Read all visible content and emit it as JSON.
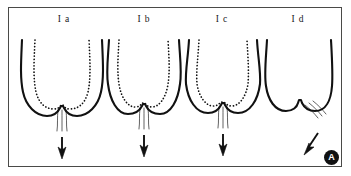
{
  "figure": {
    "kind": "anatomical-line-diagram",
    "badge_label": "A",
    "background_color": "#ffffff",
    "ink_color": "#111111",
    "frame_color": "#4a4a48",
    "panels": [
      {
        "id": "Ia",
        "label": "I a",
        "label_x": 64,
        "contour_has_dotted_inner_outline": true,
        "flow_line_count": 3,
        "flow_direction": "vertical",
        "arrow_label": "",
        "arrow_direction": "down",
        "body": "M 22 40 C 21 62 20 78 23 92 C 26 106 36 116 47 116 C 54 116 58 112 60 108 L 61 106 L 63 106 L 64 108 C 66 112 70 116 77 116 C 88 116 98 106 101 92 C 104 78 103 62 102 40",
        "dotted": "M 35 40 C 34 62 33 78 36 92 C 39 104 46 109 54 109 C 58 109 60 107 61 105 L 63 105 C 64 107 66 109 70 109 C 78 109 85 104 88 92 C 91 78 90 62 89 40",
        "flow_paths": [
          "M 58 110 C 57 118 58 124 57 131",
          "M 62 110 C 62 118 62 124 62 131",
          "M 66 110 C 67 118 66 124 67 131"
        ],
        "arrow_shaft": "M 62 137 L 62 152",
        "arrow_head": "62,159 58,147 62,150 66,147"
      },
      {
        "id": "Ib",
        "label": "I b",
        "label_x": 144,
        "contour_has_dotted_inner_outline": true,
        "flow_line_count": 3,
        "flow_direction": "vertical",
        "arrow_label": "",
        "arrow_direction": "down",
        "body": "M 109 40 C 108 58 106 72 108 84 C 110 100 117 114 128 114 C 136 114 140 110 142 106 L 143 104 L 145 104 L 146 106 C 148 110 152 114 160 114 C 171 114 178 100 180 84 C 182 72 180 58 179 40",
        "dotted": "M 119 40 C 118 58 117 72 119 84 C 121 98 128 107 135 107 C 139 107 141 105 142 103 L 145 103 C 146 105 148 107 152 107 C 159 107 166 98 168 84 C 170 72 169 58 168 40",
        "flow_paths": [
          "M 140 108 C 139 116 140 122 139 129",
          "M 144 108 C 144 116 144 122 144 129",
          "M 148 108 C 149 116 148 122 149 129"
        ],
        "arrow_shaft": "M 144 135 L 144 150",
        "arrow_head": "144,157 140,145 144,148 148,145"
      },
      {
        "id": "Ic",
        "label": "I c",
        "label_x": 222,
        "contour_has_dotted_inner_outline": true,
        "flow_line_count": 3,
        "flow_direction": "vertical",
        "arrow_label": "",
        "arrow_direction": "down",
        "body": "M 189 40 C 188 58 185 72 186 84 C 188 100 196 113 208 113 C 215 113 219 109 221 105 L 222 103 L 224 103 L 225 105 C 227 109 231 113 238 113 C 250 113 258 100 260 84 C 261 72 258 58 257 40",
        "dotted": "M 199 40 C 198 58 196 72 197 84 C 199 97 206 106 213 106 C 217 106 219 104 221 102 L 224 102 C 226 104 228 106 232 106 C 239 106 246 97 248 84 C 249 72 248 58 247 40",
        "flow_paths": [
          "M 219 107 C 218 115 219 121 218 128",
          "M 223 107 C 223 115 223 121 223 128",
          "M 227 107 C 228 115 227 121 228 128"
        ],
        "arrow_shaft": "M 223 134 L 223 149",
        "arrow_head": "223,156 219,144 223,147 227,144"
      },
      {
        "id": "Id",
        "label": "I d",
        "label_x": 298,
        "contour_has_dotted_inner_outline": false,
        "flow_line_count": 3,
        "flow_direction": "diagonal",
        "arrow_label": "",
        "arrow_direction": "down-left-diagonal",
        "body": "M 267 40 C 266 58 264 74 266 86 C 268 100 275 111 286 111 C 293 111 297 107 298 103 L 299 100 L 301 100 L 302 103 C 304 107 308 111 315 111 C 326 111 331 100 332 86 C 333 74 332 58 331 40",
        "flow_paths": [
          "M 305 105 C 310 109 314 113 318 118",
          "M 309 103 C 314 107 318 111 322 116",
          "M 313 101 C 318 105 322 109 326 114"
        ],
        "arrow_shaft": "M 308 148 L 318 133",
        "arrow_head": "304,155 309,143 310,147 314,147"
      }
    ]
  }
}
